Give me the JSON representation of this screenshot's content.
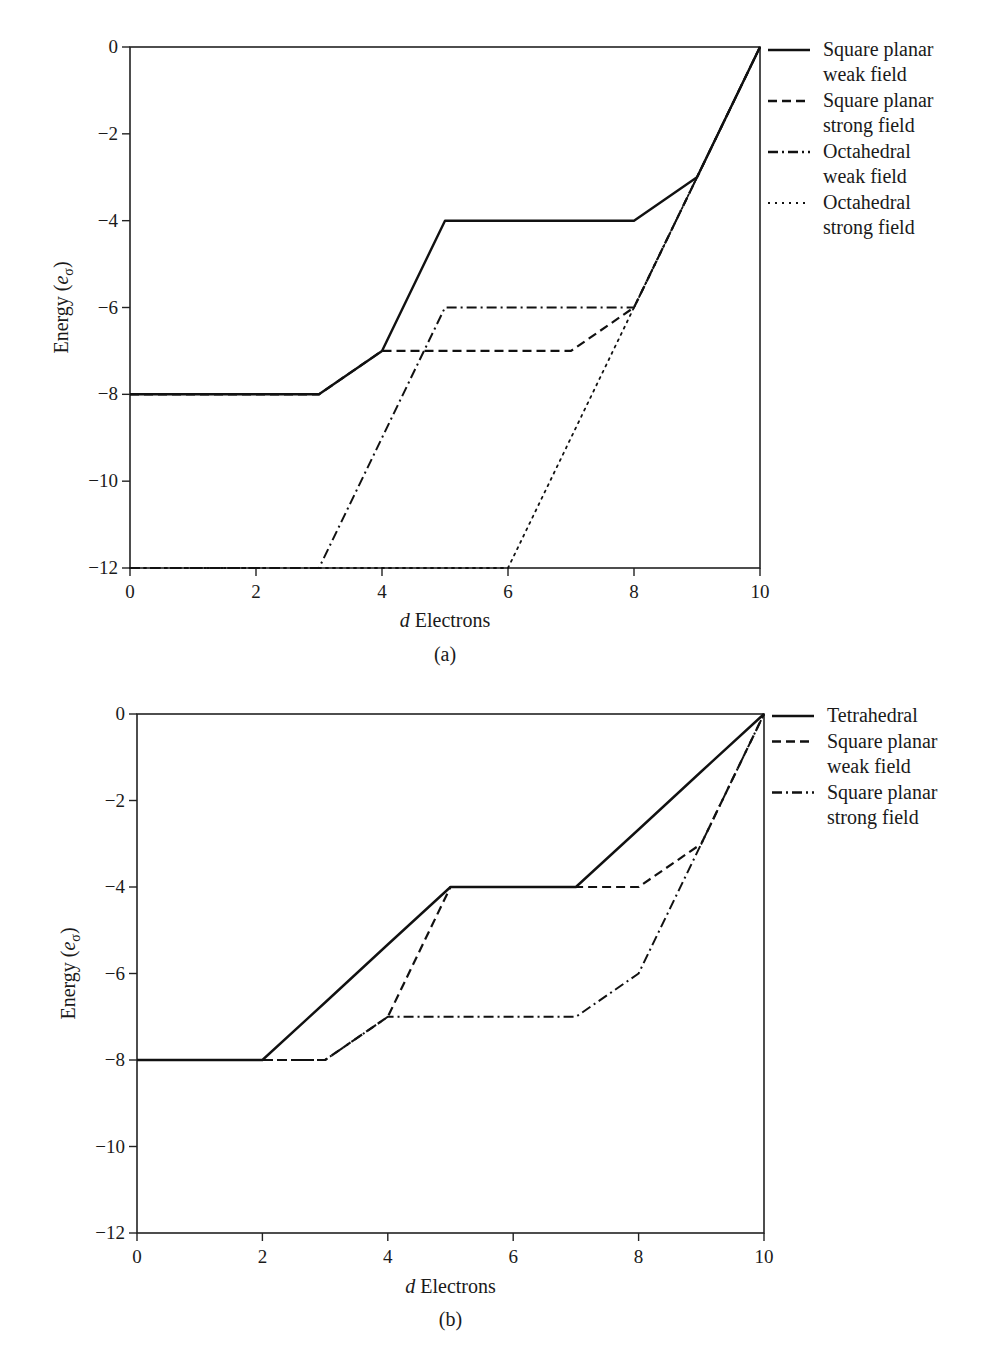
{
  "chart_data": [
    {
      "type": "line",
      "panel_label": "(a)",
      "title": "",
      "xlabel_italic": "d",
      "xlabel_rest": " Electrons",
      "ylabel": "Energy (eσ)",
      "xlim": [
        0,
        10
      ],
      "ylim": [
        -12,
        0
      ],
      "xticks": [
        "0",
        "2",
        "4",
        "6",
        "8",
        "10"
      ],
      "yticks": [
        "0",
        "−2",
        "−4",
        "−6",
        "−8",
        "−10",
        "−12"
      ],
      "grid": false,
      "legend_position": "right-outside-top",
      "x": [
        0,
        1,
        2,
        3,
        4,
        5,
        6,
        7,
        8,
        9,
        10
      ],
      "series": [
        {
          "name": "Square planar weak field",
          "legend_lines": [
            "Square planar",
            "weak field"
          ],
          "style": "solid",
          "values": [
            -8,
            -8,
            -8,
            -8,
            -7,
            -4,
            -4,
            -4,
            -4,
            -3,
            0
          ]
        },
        {
          "name": "Square planar strong field",
          "legend_lines": [
            "Square planar",
            "strong field"
          ],
          "style": "dashed",
          "values": [
            -8,
            -8,
            -8,
            -8,
            -7,
            -7,
            -7,
            -7,
            -6,
            -3,
            0
          ]
        },
        {
          "name": "Octahedral weak field",
          "legend_lines": [
            "Octahedral",
            "weak field"
          ],
          "style": "dashdot",
          "values": [
            -12,
            -12,
            -12,
            -12,
            -9,
            -6,
            -6,
            -6,
            -6,
            -3,
            0
          ]
        },
        {
          "name": "Octahedral strong field",
          "legend_lines": [
            "Octahedral",
            "strong field"
          ],
          "style": "dotted",
          "values": [
            -12,
            -12,
            -12,
            -12,
            -12,
            -12,
            -12,
            -9,
            -6,
            -3,
            0
          ]
        }
      ]
    },
    {
      "type": "line",
      "panel_label": "(b)",
      "title": "",
      "xlabel_italic": "d",
      "xlabel_rest": " Electrons",
      "ylabel": "Energy (eσ)",
      "xlim": [
        0,
        10
      ],
      "ylim": [
        -12,
        0
      ],
      "xticks": [
        "0",
        "2",
        "4",
        "6",
        "8",
        "10"
      ],
      "yticks": [
        "0",
        "−2",
        "−4",
        "−6",
        "−8",
        "−10",
        "−12"
      ],
      "grid": false,
      "legend_position": "right-outside-top",
      "x": [
        0,
        1,
        2,
        3,
        4,
        5,
        6,
        7,
        8,
        9,
        10
      ],
      "series": [
        {
          "name": "Tetrahedral",
          "legend_lines": [
            "Tetrahedral"
          ],
          "style": "solid",
          "values": [
            -8,
            -8,
            -8,
            -6.67,
            -5.33,
            -4,
            -4,
            -4,
            -2.67,
            -1.33,
            0
          ]
        },
        {
          "name": "Square planar weak field",
          "legend_lines": [
            "Square planar",
            "weak field"
          ],
          "style": "dashed",
          "values": [
            -8,
            -8,
            -8,
            -8,
            -7,
            -4,
            -4,
            -4,
            -4,
            -3,
            0
          ]
        },
        {
          "name": "Square planar strong field",
          "legend_lines": [
            "Square planar",
            "strong field"
          ],
          "style": "dashdot",
          "values": [
            -8,
            -8,
            -8,
            -8,
            -7,
            -7,
            -7,
            -7,
            -6,
            -3,
            0
          ]
        }
      ]
    }
  ]
}
